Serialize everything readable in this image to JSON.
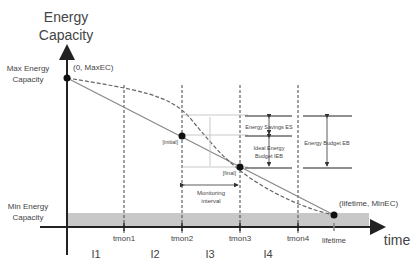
{
  "diagram": {
    "y_axis_title_line1": "Energy",
    "y_axis_title_line2": "Capacity",
    "x_axis_title": "time",
    "max_label_line1": "Max Energy",
    "max_label_line2": "Capacity",
    "min_label_line1": "Min Energy",
    "min_label_line2": "Capacity",
    "point_start": "(0, MaxEC)",
    "point_end": "(lifetime, MinEC)",
    "point_initial": "[initial]",
    "point_final": "[final]",
    "monitoring_line1": "Monitoring",
    "monitoring_line2": "interval",
    "energy_savings": "Energy Savings ES",
    "ideal_budget_line1": "Ideal Energy",
    "ideal_budget_line2": "Budget IEB",
    "energy_budget": "Energy Budget EB",
    "x_ticks": [
      "tmon1",
      "tmon2",
      "tmon3",
      "tmon4",
      "lifetime"
    ],
    "intervals": [
      "I1",
      "I2",
      "I3",
      "I4"
    ],
    "colors": {
      "axis": "#222222",
      "min_band": "#c8c8c8",
      "ideal_line": "#888888",
      "actual_curve": "#666666"
    }
  }
}
